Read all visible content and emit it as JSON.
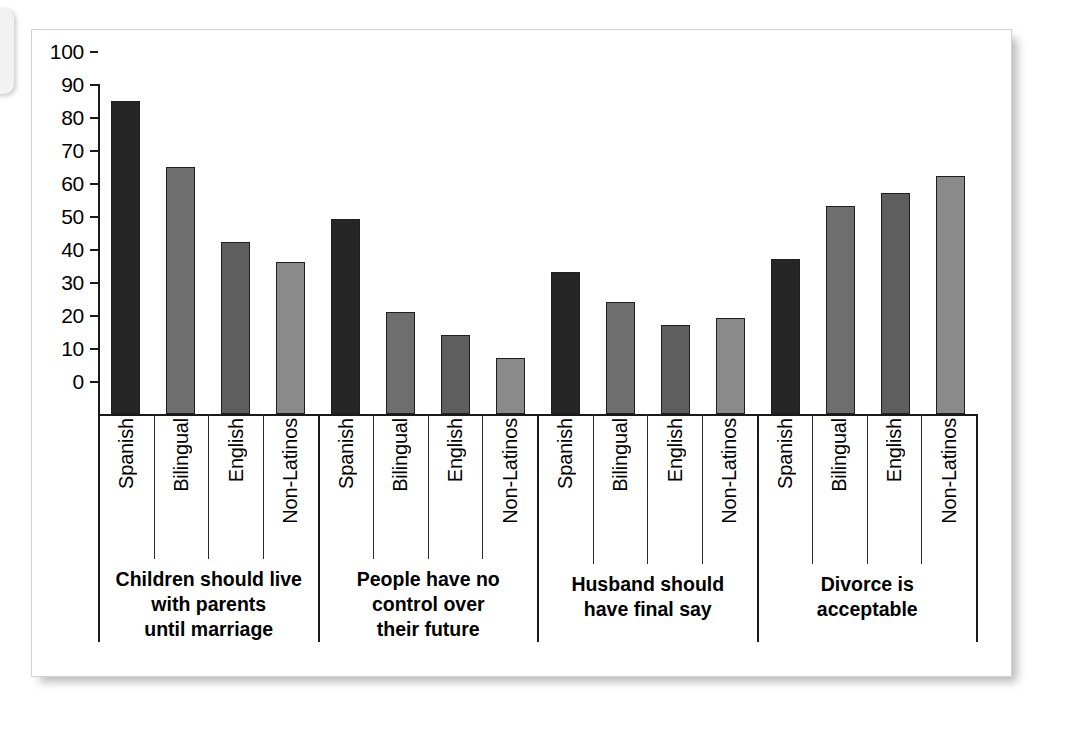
{
  "chart_data": {
    "type": "bar",
    "title": "",
    "subtitle": "",
    "xlabel": "",
    "ylabel": "",
    "ylim": [
      0,
      100
    ],
    "y_ticks": [
      0,
      10,
      20,
      30,
      40,
      50,
      60,
      70,
      80,
      90,
      100
    ],
    "grid": false,
    "legend": "none",
    "categories": [
      "Spanish",
      "Bilingual",
      "English",
      "Non-Latinos"
    ],
    "groups": [
      "Children should live with parents until marriage",
      "People have no control over their future",
      "Husband should have final say",
      "Divorce is acceptable"
    ],
    "group_label_lines": [
      [
        "Children should live",
        "with parents",
        "until marriage"
      ],
      [
        "People have no",
        "control over",
        "their future"
      ],
      [
        "Husband should",
        "have final say"
      ],
      [
        "Divorce is",
        "acceptable"
      ]
    ],
    "series": [
      {
        "name": "Spanish",
        "values": [
          95,
          59,
          43,
          47
        ]
      },
      {
        "name": "Bilingual",
        "values": [
          75,
          31,
          34,
          63
        ]
      },
      {
        "name": "English",
        "values": [
          52,
          24,
          27,
          67
        ]
      },
      {
        "name": "Non-Latinos",
        "values": [
          46,
          17,
          29,
          72
        ]
      }
    ],
    "group_values": [
      [
        95,
        75,
        52,
        46
      ],
      [
        59,
        31,
        24,
        17
      ],
      [
        43,
        34,
        27,
        29
      ],
      [
        47,
        63,
        67,
        72
      ]
    ],
    "colors": {
      "Spanish": "#262626",
      "Bilingual": "#6e6e6e",
      "English": "#5e5e5e",
      "Non-Latinos": "#8a8a8a",
      "axis": "#1a1a1a",
      "bar_outline": "#1f1f1f",
      "card_background": "#ffffff",
      "card_border": "#d2d2d2"
    }
  }
}
